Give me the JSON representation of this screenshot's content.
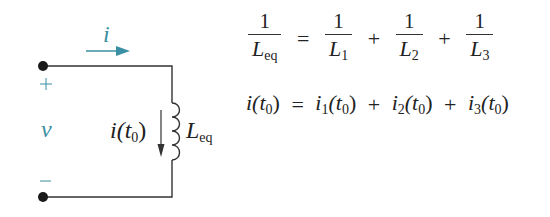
{
  "circuit": {
    "current_label": "i",
    "plus_label": "+",
    "voltage_label": "v",
    "minus_label": "−",
    "inductor_current_label": "i(t",
    "inductor_current_sub": "0",
    "inductor_current_close": ")",
    "inductor_label": "L",
    "inductor_sub": "eq",
    "colors": {
      "wire": "#333333",
      "accent": "#3a8fa3",
      "terminal": "#1a1a1a"
    }
  },
  "equations": {
    "eq1": {
      "lhs_num": "1",
      "lhs_den": "L",
      "lhs_den_sub": "eq",
      "equals": "=",
      "terms": [
        {
          "num": "1",
          "den": "L",
          "sub": "1"
        },
        {
          "num": "1",
          "den": "L",
          "sub": "2"
        },
        {
          "num": "1",
          "den": "L",
          "sub": "3"
        }
      ],
      "plus": "+"
    },
    "eq2": {
      "lhs": "i(t",
      "lhs_sub": "0",
      "lhs_close": ")",
      "equals": "=",
      "t1": "i",
      "t1_sub": "1",
      "t1_arg": "(t",
      "t1_arg_sub": "0",
      "t1_close": ")",
      "t2": "i",
      "t2_sub": "2",
      "t2_arg": "(t",
      "t2_arg_sub": "0",
      "t2_close": ")",
      "t3": "i",
      "t3_sub": "3",
      "t3_arg": "(t",
      "t3_arg_sub": "0",
      "t3_close": ")",
      "plus": "+"
    }
  }
}
